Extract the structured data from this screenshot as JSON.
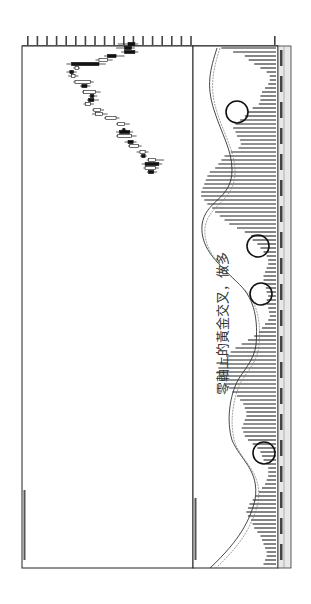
{
  "chart_data": {
    "type": "candlestick+macd",
    "orientation": "rotated-90-clockwise",
    "title": "",
    "annotation": "零軸上的黃金交叉，做多",
    "price_axis": {
      "tick_count": 18,
      "position": "top"
    },
    "macd_axis": {
      "zero_line": true
    },
    "date_axis": {
      "position": "right",
      "label_count": 20
    },
    "legend_price": "price panel header (illegible small text)",
    "legend_macd": "MACD panel header (illegible small text)",
    "candles": [
      [
        44,
        0.58,
        0.66,
        0.62,
        0.68,
        0.56
      ],
      [
        48,
        0.58,
        0.64,
        0.6,
        0.66,
        0.55
      ],
      [
        52,
        1,
        0.6,
        0.66,
        0.68,
        0.58
      ],
      [
        56,
        1,
        0.5,
        0.55,
        0.6,
        0.48
      ],
      [
        60,
        0,
        0.45,
        0.5,
        0.53,
        0.43
      ],
      [
        64,
        1,
        0.29,
        0.45,
        0.49,
        0.26
      ],
      [
        68,
        0,
        0.31,
        0.33,
        0.34,
        0.3
      ],
      [
        72,
        1,
        0.28,
        0.3,
        0.32,
        0.26
      ],
      [
        76,
        0,
        0.29,
        0.31,
        0.33,
        0.27
      ],
      [
        82,
        0,
        0.31,
        0.4,
        0.42,
        0.3
      ],
      [
        86,
        1,
        0.35,
        0.38,
        0.4,
        0.34
      ],
      [
        92,
        0,
        0.36,
        0.43,
        0.46,
        0.35
      ],
      [
        96,
        1,
        0.4,
        0.42,
        0.44,
        0.39
      ],
      [
        100,
        1,
        0.39,
        0.42,
        0.45,
        0.38
      ],
      [
        104,
        0,
        0.37,
        0.4,
        0.42,
        0.36
      ],
      [
        110,
        0,
        0.42,
        0.46,
        0.48,
        0.41
      ],
      [
        114,
        0,
        0.43,
        0.47,
        0.5,
        0.41
      ],
      [
        118,
        0,
        0.49,
        0.55,
        0.57,
        0.48
      ],
      [
        124,
        0,
        0.56,
        0.6,
        0.63,
        0.55
      ],
      [
        130,
        1,
        0.59,
        0.6,
        0.61,
        0.58
      ],
      [
        132,
        1,
        0.57,
        0.63,
        0.65,
        0.55
      ],
      [
        136,
        0,
        0.56,
        0.64,
        0.67,
        0.55
      ],
      [
        142,
        1,
        0.62,
        0.65,
        0.67,
        0.6
      ],
      [
        146,
        0,
        0.63,
        0.68,
        0.7,
        0.62
      ],
      [
        152,
        0,
        0.69,
        0.72,
        0.74,
        0.67
      ],
      [
        156,
        1,
        0.7,
        0.72,
        0.73,
        0.69
      ],
      [
        160,
        0,
        0.74,
        0.78,
        0.83,
        0.73
      ],
      [
        164,
        1,
        0.72,
        0.8,
        0.82,
        0.7
      ],
      [
        168,
        0,
        0.72,
        0.78,
        0.8,
        0.71
      ],
      [
        172,
        1,
        0.74,
        0.77,
        0.79,
        0.73
      ]
    ],
    "macd_hist": [
      [
        48,
        0.7
      ],
      [
        52,
        0.55
      ],
      [
        56,
        0.4
      ],
      [
        60,
        0.35
      ],
      [
        64,
        0.28
      ],
      [
        68,
        0.2
      ],
      [
        72,
        0.12
      ],
      [
        76,
        0.08
      ],
      [
        80,
        0.08
      ],
      [
        84,
        0.1
      ],
      [
        88,
        0.14
      ],
      [
        92,
        0.18
      ],
      [
        96,
        0.2
      ],
      [
        100,
        0.2
      ],
      [
        104,
        0.22
      ],
      [
        108,
        0.3
      ],
      [
        112,
        0.36
      ],
      [
        116,
        0.4
      ],
      [
        120,
        0.46
      ],
      [
        124,
        0.52
      ],
      [
        128,
        0.55
      ],
      [
        132,
        0.52
      ],
      [
        136,
        0.5
      ],
      [
        140,
        0.46
      ],
      [
        144,
        0.45
      ],
      [
        148,
        0.48
      ],
      [
        152,
        0.58
      ],
      [
        156,
        0.66
      ],
      [
        160,
        0.7
      ],
      [
        164,
        0.74
      ],
      [
        168,
        0.78
      ],
      [
        172,
        0.85
      ],
      [
        176,
        0.88
      ],
      [
        180,
        0.9
      ],
      [
        184,
        0.92
      ],
      [
        188,
        0.94
      ],
      [
        192,
        0.96
      ],
      [
        196,
        0.96
      ],
      [
        200,
        0.92
      ],
      [
        204,
        0.88
      ],
      [
        208,
        0.82
      ],
      [
        212,
        0.78
      ],
      [
        216,
        0.72
      ],
      [
        220,
        0.66
      ],
      [
        224,
        0.6
      ],
      [
        228,
        0.5
      ],
      [
        232,
        0.4
      ],
      [
        236,
        0.32
      ],
      [
        240,
        0.3
      ],
      [
        244,
        0.24
      ],
      [
        248,
        0.2
      ],
      [
        252,
        0.16
      ],
      [
        256,
        0.12
      ],
      [
        260,
        0.1
      ],
      [
        264,
        0.1
      ],
      [
        268,
        0.12
      ],
      [
        272,
        0.14
      ],
      [
        276,
        0.16
      ],
      [
        280,
        0.16
      ],
      [
        284,
        0.15
      ],
      [
        288,
        0.13
      ],
      [
        292,
        0.12
      ],
      [
        296,
        0.1
      ],
      [
        300,
        0.12
      ],
      [
        304,
        0.12
      ],
      [
        308,
        0.1
      ],
      [
        312,
        0.09
      ],
      [
        316,
        0.08
      ],
      [
        320,
        0.1
      ],
      [
        324,
        0.14
      ],
      [
        328,
        0.18
      ],
      [
        332,
        0.22
      ],
      [
        336,
        0.28
      ],
      [
        340,
        0.36
      ],
      [
        344,
        0.44
      ],
      [
        348,
        0.52
      ],
      [
        352,
        0.58
      ],
      [
        356,
        0.64
      ],
      [
        360,
        0.68
      ],
      [
        364,
        0.72
      ],
      [
        368,
        0.74
      ],
      [
        372,
        0.76
      ],
      [
        376,
        0.74
      ],
      [
        380,
        0.7
      ],
      [
        384,
        0.66
      ],
      [
        388,
        0.6
      ],
      [
        392,
        0.56
      ],
      [
        396,
        0.5
      ],
      [
        400,
        0.46
      ],
      [
        404,
        0.42
      ],
      [
        408,
        0.4
      ],
      [
        412,
        0.38
      ],
      [
        416,
        0.38
      ],
      [
        420,
        0.4
      ],
      [
        424,
        0.42
      ],
      [
        428,
        0.44
      ],
      [
        432,
        0.42
      ],
      [
        436,
        0.4
      ],
      [
        440,
        0.36
      ],
      [
        444,
        0.3
      ],
      [
        448,
        0.24
      ],
      [
        452,
        0.2
      ],
      [
        456,
        0.18
      ],
      [
        460,
        0.16
      ],
      [
        464,
        0.12
      ],
      [
        468,
        0.1
      ],
      [
        472,
        0.1
      ],
      [
        476,
        0.1
      ],
      [
        480,
        0.12
      ],
      [
        484,
        0.14
      ],
      [
        488,
        0.18
      ],
      [
        492,
        0.22
      ],
      [
        496,
        0.26
      ],
      [
        500,
        0.3
      ],
      [
        504,
        0.34
      ],
      [
        508,
        0.36
      ],
      [
        512,
        0.38
      ],
      [
        516,
        0.36
      ],
      [
        520,
        0.32
      ],
      [
        524,
        0.3
      ],
      [
        528,
        0.28
      ],
      [
        532,
        0.24
      ],
      [
        536,
        0.2
      ],
      [
        540,
        0.18
      ],
      [
        544,
        0.16
      ],
      [
        548,
        0.14
      ],
      [
        552,
        0.12
      ],
      [
        556,
        0.12
      ],
      [
        560,
        0.14
      ],
      [
        564,
        0.16
      ]
    ],
    "golden_cross_circles": [
      [
        237,
        112
      ],
      [
        258,
        246
      ],
      [
        261,
        294
      ],
      [
        264,
        453
      ]
    ]
  }
}
